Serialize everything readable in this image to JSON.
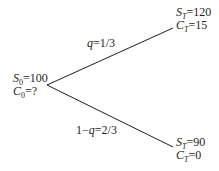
{
  "diagram": {
    "type": "binomial-tree",
    "colors": {
      "line": "#231f20",
      "text": "#231f20",
      "background": "#ffffff"
    },
    "root": {
      "stock_label": "S",
      "stock_sub": "0",
      "stock_value": "=100",
      "option_label": "C",
      "option_sub": "0",
      "option_value": "=?"
    },
    "up": {
      "prob_var": "q",
      "prob_value": "=1/3",
      "stock_label": "S",
      "stock_sub": "T",
      "stock_value": "=120",
      "option_label": "C",
      "option_sub": "T",
      "option_value": "=15"
    },
    "down": {
      "prob_prefix": "1−",
      "prob_var": "q",
      "prob_value": "=2/3",
      "stock_label": "S",
      "stock_sub": "T",
      "stock_value": "=90",
      "option_label": "C",
      "option_sub": "T",
      "option_value": "=0"
    }
  }
}
